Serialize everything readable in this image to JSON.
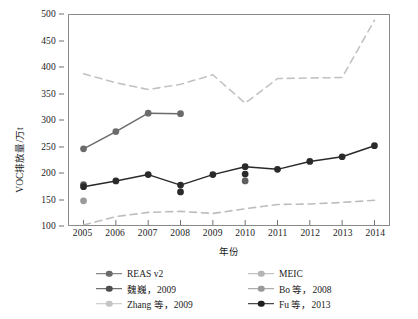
{
  "chart_data": {
    "type": "line",
    "title": "",
    "xlabel": "年份",
    "ylabel": "VOC排放量/万t",
    "x": [
      2005,
      2006,
      2007,
      2008,
      2009,
      2010,
      2011,
      2012,
      2013,
      2014
    ],
    "xtick_labels": [
      "2005",
      "2006",
      "2007",
      "2008",
      "2009",
      "2010",
      "2011",
      "2012",
      "2013",
      "2014"
    ],
    "ytick_labels": [
      "100",
      "150",
      "200",
      "250",
      "300",
      "350",
      "400",
      "450",
      "500"
    ],
    "yticks": [
      100,
      150,
      200,
      250,
      300,
      350,
      400,
      450,
      500
    ],
    "xlim": [
      2004.55,
      2014.45
    ],
    "ylim": [
      100,
      500
    ],
    "grid": false,
    "legend_position": "below-plot",
    "series": [
      {
        "name": "REAS v2",
        "color": "#6b6b6b",
        "style": "solid",
        "marker": "circle",
        "x": [
          2005,
          2006,
          2007,
          2008
        ],
        "values": [
          245,
          278,
          313,
          312
        ]
      },
      {
        "name": "MEIC",
        "color": "#c2c2c2",
        "style": "dashed",
        "marker": "none",
        "x": [
          2005,
          2006,
          2007,
          2008,
          2009,
          2010,
          2011,
          2012,
          2013,
          2014
        ],
        "values": [
          388,
          371,
          358,
          368,
          386,
          332,
          379,
          380,
          381,
          490
        ]
      },
      {
        "name": "魏巍，2009",
        "color": "#5a5a5a",
        "style": "solid",
        "marker": "circle",
        "x": [
          2005
        ],
        "values": [
          177
        ]
      },
      {
        "name": "Bo 等，2008",
        "color": "#9a9a9a",
        "style": "solid",
        "marker": "circle",
        "x": [
          2005
        ],
        "values": [
          146
        ]
      },
      {
        "name": "Zhang 等，2009",
        "color": "#bdbdbd",
        "style": "dashed",
        "marker": "none",
        "x": [
          2005,
          2006,
          2007,
          2008,
          2009,
          2010,
          2011,
          2012,
          2013,
          2014
        ],
        "values": [
          100,
          116,
          124,
          126,
          122,
          131,
          139,
          140,
          143,
          147
        ]
      },
      {
        "name": "Fu 等，2013",
        "color": "#2a2a2a",
        "style": "solid",
        "marker": "circle",
        "x": [
          2005,
          2006,
          2007,
          2008,
          2009,
          2010,
          2011,
          2012,
          2013,
          2014
        ],
        "values": [
          173,
          184,
          196,
          176,
          196,
          211,
          206,
          221,
          230,
          251
        ]
      }
    ],
    "extra_points": [
      {
        "name": "Fu 等，2013 secondary 2008",
        "x": 2008,
        "value": 163,
        "color": "#2a2a2a"
      },
      {
        "name": "Fu 等，2013 secondary 2010 mid",
        "x": 2010,
        "value": 197,
        "color": "#2a2a2a"
      },
      {
        "name": "Fu 等，2013 secondary 2010 low",
        "x": 2010,
        "value": 184,
        "color": "#5f5f5f"
      }
    ]
  },
  "axes": {
    "y_title": "VOC排放量/万t",
    "x_title": "年份"
  },
  "legend": {
    "entries": [
      {
        "label": "REAS v2",
        "color": "#6b6b6b",
        "style": "solid",
        "marker": "circle"
      },
      {
        "label": "MEIC",
        "color": "#b5b5b5",
        "style": "solid",
        "marker": "circle"
      },
      {
        "label": "魏巍，2009",
        "color": "#4f4f4f",
        "style": "solid",
        "marker": "circle"
      },
      {
        "label": "Bo 等，2008",
        "color": "#9a9a9a",
        "style": "solid",
        "marker": "circle"
      },
      {
        "label": "Zhang 等，2009",
        "color": "#c4c4c4",
        "style": "solid",
        "marker": "circle"
      },
      {
        "label": "Fu 等，2013",
        "color": "#1f1f1f",
        "style": "solid",
        "marker": "circle"
      }
    ]
  }
}
